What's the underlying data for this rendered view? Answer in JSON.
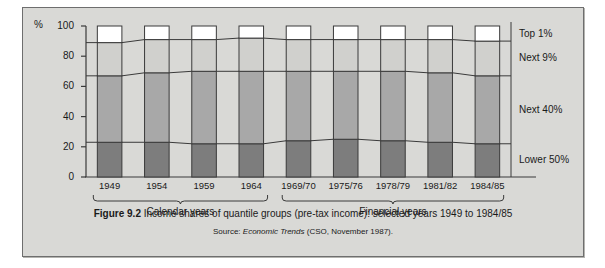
{
  "figure": {
    "caption_label": "Figure 9.2",
    "caption_text": "Income shares of quantile groups (pre-tax income): selected years 1949 to 1984/85",
    "source_prefix": "Source:",
    "source_italic": "Economic Trends",
    "source_rest": "(CSO, November 1987)."
  },
  "chart_data": {
    "type": "bar",
    "title": "Income shares of quantile groups (pre-tax income): selected years 1949 to 1984/85",
    "xlabel": "",
    "ylabel": "%",
    "unit": "%",
    "ylim": [
      0,
      100
    ],
    "yticks": [
      0,
      20,
      40,
      60,
      80,
      100
    ],
    "grid": false,
    "stacked": true,
    "legend_position": "right",
    "categories": [
      "1949",
      "1954",
      "1959",
      "1964",
      "1969/70",
      "1975/76",
      "1978/79",
      "1981/82",
      "1984/85"
    ],
    "series": [
      {
        "name": "Lower 50%",
        "color": "#7d7d7d",
        "values": [
          23,
          23,
          22,
          22,
          24,
          25,
          24,
          23,
          22
        ]
      },
      {
        "name": "Next 40%",
        "color": "#a8a8a8",
        "values": [
          44,
          46,
          48,
          48,
          46,
          45,
          46,
          46,
          45
        ]
      },
      {
        "name": "Next 9%",
        "color": "#d0d0cd",
        "values": [
          22,
          22,
          21,
          22,
          21,
          21,
          21,
          22,
          23
        ]
      },
      {
        "name": "Top 1%",
        "color": "#ffffff",
        "values": [
          11,
          9,
          9,
          8,
          9,
          9,
          9,
          9,
          10
        ]
      }
    ],
    "cumulative_boundaries": {
      "lower50_top": [
        23,
        23,
        22,
        22,
        24,
        25,
        24,
        23,
        22
      ],
      "next40_top": [
        67,
        69,
        70,
        70,
        70,
        70,
        70,
        69,
        67
      ],
      "next9_top": [
        89,
        91,
        91,
        92,
        91,
        91,
        91,
        91,
        90
      ]
    },
    "legend_entries": [
      "Top 1%",
      "Next 9%",
      "Next 40%",
      "Lower 50%"
    ],
    "group_brackets": [
      {
        "label": "Calendar years",
        "from": "1949",
        "to": "1964"
      },
      {
        "label": "Financial years",
        "from": "1969/70",
        "to": "1984/85"
      }
    ]
  }
}
